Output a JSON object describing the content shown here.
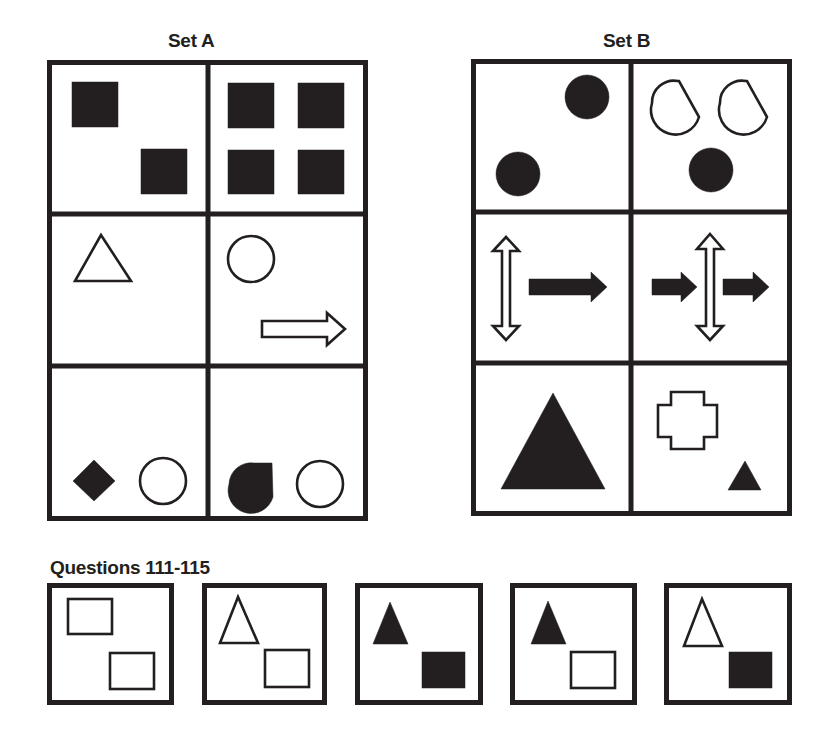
{
  "set_a": {
    "title": "Set A",
    "box": {
      "x": 47,
      "y": 60,
      "w": 321,
      "h": 461
    },
    "cols": [
      47,
      208,
      368
    ],
    "rows": [
      60,
      214,
      366,
      521
    ],
    "cells": [
      {
        "name": "set-a-cell-1-1",
        "shapes": [
          {
            "type": "rect",
            "fill": "black",
            "x": 72,
            "y": 82,
            "w": 46,
            "h": 45,
            "icon": "filled-square-icon"
          },
          {
            "type": "rect",
            "fill": "black",
            "x": 141,
            "y": 149,
            "w": 46,
            "h": 45,
            "icon": "filled-square-icon"
          }
        ]
      },
      {
        "name": "set-a-cell-1-2",
        "shapes": [
          {
            "type": "rect",
            "fill": "black",
            "x": 228,
            "y": 83,
            "w": 46,
            "h": 45,
            "icon": "filled-square-icon"
          },
          {
            "type": "rect",
            "fill": "black",
            "x": 298,
            "y": 83,
            "w": 46,
            "h": 45,
            "icon": "filled-square-icon"
          },
          {
            "type": "rect",
            "fill": "black",
            "x": 228,
            "y": 150,
            "w": 46,
            "h": 44,
            "icon": "filled-square-icon"
          },
          {
            "type": "rect",
            "fill": "black",
            "x": 298,
            "y": 150,
            "w": 46,
            "h": 44,
            "icon": "filled-square-icon"
          }
        ]
      },
      {
        "name": "set-a-cell-2-1",
        "shapes": [
          {
            "type": "polygon",
            "fill": "white",
            "points": "101,235 75,281 131,281",
            "icon": "outline-triangle-icon"
          }
        ]
      },
      {
        "name": "set-a-cell-2-2",
        "shapes": [
          {
            "type": "circle",
            "fill": "white",
            "cx": 251,
            "cy": 259,
            "r": 23,
            "icon": "outline-circle-icon"
          },
          {
            "type": "polygon",
            "fill": "white",
            "points": "262,321 327,321 327,313 345,329 327,345 327,337 262,337",
            "icon": "outline-right-arrow-icon"
          }
        ]
      },
      {
        "name": "set-a-cell-3-1",
        "shapes": [
          {
            "type": "polygon",
            "fill": "black",
            "points": "94,460 115,481 94,501 73,481",
            "icon": "filled-diamond-icon"
          },
          {
            "type": "circle",
            "fill": "white",
            "cx": 163,
            "cy": 481,
            "r": 23,
            "icon": "outline-circle-icon"
          }
        ]
      },
      {
        "name": "set-a-cell-3-2",
        "shapes": [
          {
            "type": "path",
            "fill": "black",
            "d": "M253,464 L273,464 L273,464 L273,464 L273,464 L273,498 Q260,507 245,503 Q229,498 229,482 Q230,468 253,464 Z",
            "icon": "filled-half-disc-icon",
            "altd": "M254,463 L272,463 L273,497 A22,22 0 0,1 229,484 A22,22 0 0,1 254,463 Z"
          },
          {
            "type": "circle",
            "fill": "white",
            "cx": 320,
            "cy": 484,
            "r": 23,
            "icon": "outline-circle-icon"
          }
        ]
      }
    ]
  },
  "set_b": {
    "title": "Set B",
    "box": {
      "x": 471,
      "y": 59,
      "w": 321,
      "h": 457
    },
    "cols": [
      471,
      631,
      792
    ],
    "rows": [
      59,
      212,
      363,
      516
    ],
    "cells": [
      {
        "name": "set-b-cell-1-1",
        "shapes": [
          {
            "type": "circle",
            "fill": "black",
            "cx": 587,
            "cy": 97,
            "r": 22,
            "icon": "filled-circle-icon"
          },
          {
            "type": "circle",
            "fill": "black",
            "cx": 518,
            "cy": 174,
            "r": 22,
            "icon": "filled-circle-icon"
          }
        ]
      },
      {
        "name": "set-b-cell-1-2",
        "shapes": [
          {
            "type": "path",
            "fill": "white",
            "d": "M679,81 L699,81 L699,81 L700,81 L700,81 L699,81 L699,81 L699,81 L699,81 L699,81 L699,81 L699,81 L699,81 Z",
            "icon": "outline-half-disc-icon",
            "altd": "M678,81 L679,81 L699,117 A22,22 0 0,1 652,103 A22,22 0 0,1 678,81 Z"
          },
          {
            "type": "path",
            "fill": "white",
            "d": "",
            "icon": "outline-half-disc-icon",
            "altd": "M746,81 L747,81 L767,117 A22,22 0 0,1 720,103 A22,22 0 0,1 746,81 Z"
          },
          {
            "type": "circle",
            "fill": "black",
            "cx": 711,
            "cy": 170,
            "r": 22,
            "icon": "filled-circle-icon"
          }
        ]
      },
      {
        "name": "set-b-cell-2-1",
        "shapes": [
          {
            "type": "polygon",
            "fill": "white",
            "points": "506,237 519,251 510,251 510,326 519,326 506,340 493,326 502,326 502,251 493,251",
            "icon": "outline-vertical-double-arrow-icon"
          },
          {
            "type": "polygon",
            "fill": "black",
            "points": "529,279 591,279 591,272 607,287 591,302 591,295 529,295",
            "icon": "filled-right-arrow-icon"
          }
        ]
      },
      {
        "name": "set-b-cell-2-2",
        "shapes": [
          {
            "type": "polygon",
            "fill": "white",
            "points": "710,234 723,249 714,249 714,326 723,326 710,340 697,326 706,326 706,249 697,249",
            "icon": "outline-vertical-double-arrow-icon"
          },
          {
            "type": "polygon",
            "fill": "black",
            "points": "652,279 681,279 681,272 697,287 681,302 681,295 652,295",
            "icon": "filled-right-arrow-icon"
          },
          {
            "type": "polygon",
            "fill": "black",
            "points": "723,279 753,279 753,272 769,287 753,302 753,295 723,295",
            "icon": "filled-right-arrow-icon"
          }
        ]
      },
      {
        "name": "set-b-cell-3-1",
        "shapes": [
          {
            "type": "polygon",
            "fill": "black",
            "points": "553,393 501,489 605,489",
            "icon": "filled-triangle-icon"
          }
        ]
      },
      {
        "name": "set-b-cell-3-2",
        "shapes": [
          {
            "type": "polygon",
            "fill": "white",
            "points": "671,392 704,392 704,405 717,405 717,437 704,437 704,449 671,449 671,437 658,437 658,405 671,405",
            "icon": "outline-cross-icon"
          },
          {
            "type": "polygon",
            "fill": "black",
            "points": "745,461 728,490 761,490",
            "icon": "filled-small-triangle-icon"
          }
        ]
      }
    ]
  },
  "questions": {
    "title": "Questions 111-115",
    "boxes": [
      {
        "number": "111",
        "x": 47,
        "y": 583,
        "w": 127,
        "h": 122,
        "shapes": [
          {
            "type": "rect",
            "fill": "white",
            "x": 68,
            "y": 599,
            "w": 44,
            "h": 35,
            "icon": "outline-rectangle-icon"
          },
          {
            "type": "rect",
            "fill": "white",
            "x": 110,
            "y": 653,
            "w": 44,
            "h": 36,
            "icon": "outline-rectangle-icon"
          }
        ]
      },
      {
        "number": "112",
        "x": 202,
        "y": 583,
        "w": 125,
        "h": 122,
        "shapes": [
          {
            "type": "polygon",
            "fill": "white",
            "points": "238,597 220,643 258,643",
            "icon": "outline-triangle-icon"
          },
          {
            "type": "rect",
            "fill": "white",
            "x": 265,
            "y": 650,
            "w": 44,
            "h": 37,
            "icon": "outline-rectangle-icon"
          }
        ]
      },
      {
        "number": "113",
        "x": 355,
        "y": 583,
        "w": 128,
        "h": 122,
        "shapes": [
          {
            "type": "polygon",
            "fill": "black",
            "points": "390,602 373,644 408,644",
            "icon": "filled-triangle-icon"
          },
          {
            "type": "rect",
            "fill": "black",
            "x": 422,
            "y": 652,
            "w": 43,
            "h": 36,
            "icon": "filled-rectangle-icon"
          }
        ]
      },
      {
        "number": "114",
        "x": 510,
        "y": 583,
        "w": 127,
        "h": 122,
        "shapes": [
          {
            "type": "polygon",
            "fill": "black",
            "points": "548,601 531,644 566,644",
            "icon": "filled-triangle-icon"
          },
          {
            "type": "rect",
            "fill": "white",
            "x": 571,
            "y": 652,
            "w": 44,
            "h": 36,
            "icon": "outline-rectangle-icon"
          }
        ]
      },
      {
        "number": "115",
        "x": 664,
        "y": 583,
        "w": 128,
        "h": 122,
        "shapes": [
          {
            "type": "polygon",
            "fill": "white",
            "points": "702,599 684,646 722,646",
            "icon": "outline-triangle-icon"
          },
          {
            "type": "rect",
            "fill": "black",
            "x": 729,
            "y": 652,
            "w": 43,
            "h": 36,
            "icon": "filled-rectangle-icon"
          }
        ]
      }
    ]
  },
  "colors": {
    "ink": "#231f20",
    "paper": "#ffffff"
  }
}
